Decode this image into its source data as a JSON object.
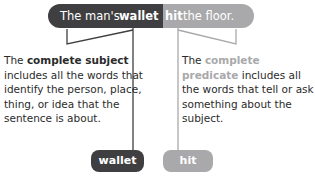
{
  "sentence": {
    "before": "The man's ",
    "subject_word": "wallet",
    "predicate_word": "hit",
    "after": " the floor."
  },
  "subject_description": {
    "prefix": "The ",
    "term": "complete subject",
    "text": " includes all the words that identify the person, place, thing, or idea that the sentence is about."
  },
  "predicate_description": {
    "prefix": "The ",
    "term": "complete predicate",
    "text": " includes all the words that tell or ask something about the subject."
  },
  "tags": {
    "subject": "wallet",
    "predicate": "hit"
  },
  "colors": {
    "subject": "#3f3f41",
    "predicate": "#a9a9ab"
  }
}
